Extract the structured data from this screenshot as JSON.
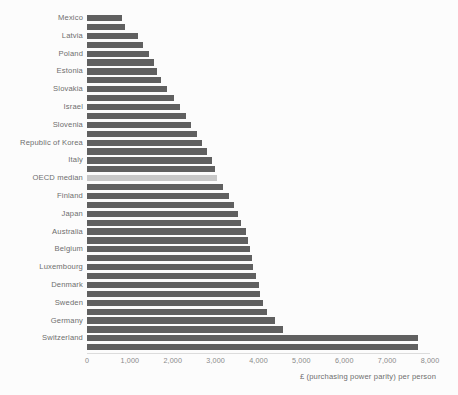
{
  "chart_data": {
    "type": "bar",
    "orientation": "horizontal",
    "title": "",
    "subtitle": "",
    "xlabel": "£ (purchasing power parity) per person",
    "ylabel": "",
    "xlim": [
      0,
      8000
    ],
    "xticks": [
      0,
      1000,
      2000,
      3000,
      4000,
      5000,
      6000,
      7000,
      8000
    ],
    "xtick_labels": [
      "0",
      "1,000",
      "2,000",
      "3,000",
      "4,000",
      "5,000",
      "6,000",
      "7,000",
      "8,000"
    ],
    "grid": false,
    "legend": null,
    "bar_color": "#606060",
    "highlight_color": "#c8c8c8",
    "highlight_category": "OECD median",
    "labeled_every_n": 2,
    "categories": [
      "Mexico",
      "",
      "Latvia",
      "",
      "Poland",
      "",
      "Estonia",
      "",
      "Slovakia",
      "",
      "Israel",
      "",
      "Slovenia",
      "",
      "Republic of Korea",
      "",
      "Italy",
      "",
      "OECD median",
      "",
      "Finland",
      "",
      "Japan",
      "",
      "Australia",
      "",
      "Belgium",
      "",
      "Luxembourg",
      "",
      "Denmark",
      "",
      "Sweden",
      "",
      "Germany",
      "",
      "Switzerland",
      ""
    ],
    "values": [
      820,
      890,
      1180,
      1300,
      1450,
      1560,
      1640,
      1720,
      1870,
      2030,
      2180,
      2300,
      2430,
      2560,
      2680,
      2800,
      2920,
      2980,
      3040,
      3180,
      3310,
      3420,
      3520,
      3600,
      3700,
      3760,
      3800,
      3840,
      3880,
      3940,
      4000,
      4040,
      4100,
      4200,
      4380,
      4560,
      7730,
      7730
    ],
    "highlight_index": 18,
    "labeled_categories": [
      "Mexico",
      "Latvia",
      "Poland",
      "Estonia",
      "Slovakia",
      "Israel",
      "Slovenia",
      "Republic of Korea",
      "Italy",
      "OECD median",
      "Finland",
      "Japan",
      "Australia",
      "Belgium",
      "Luxembourg",
      "Denmark",
      "Sweden",
      "Germany",
      "Switzerland"
    ]
  }
}
